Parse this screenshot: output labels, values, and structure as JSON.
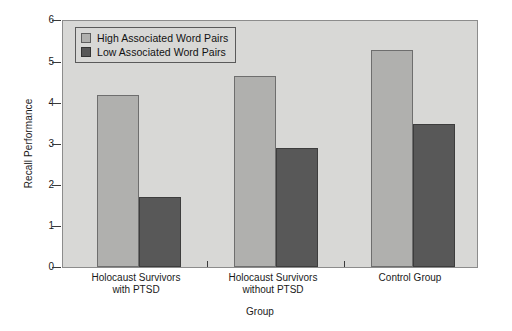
{
  "chart_data": {
    "type": "bar",
    "title": "",
    "xlabel": "Group",
    "ylabel": "Recall Performance",
    "ylim": [
      0,
      6
    ],
    "yticks": [
      0,
      1,
      2,
      3,
      4,
      5,
      6
    ],
    "ytick_labels": [
      "0",
      "1",
      "2",
      "3",
      "4",
      "5",
      "6"
    ],
    "grid": false,
    "legend_position": "upper left (inside axes)",
    "categories": [
      "Holocaust Survivors with PTSD",
      "Holocaust Survivors without PTSD",
      "Control Group"
    ],
    "category_lines": [
      [
        "Holocaust Survivors",
        "with PTSD"
      ],
      [
        "Holocaust Survivors",
        "without PTSD"
      ],
      [
        "Control Group",
        ""
      ]
    ],
    "series": [
      {
        "name": "High Associated Word Pairs",
        "color": "#b0b0ae",
        "values": [
          4.2,
          4.65,
          5.3
        ]
      },
      {
        "name": "Low Associated Word Pairs",
        "color": "#585858",
        "values": [
          1.7,
          2.9,
          3.5
        ]
      }
    ]
  },
  "axes": {
    "ylabel": "Recall Performance",
    "xlabel": "Group",
    "ytick_labels": [
      "0",
      "1",
      "2",
      "3",
      "4",
      "5",
      "6"
    ]
  },
  "legend": {
    "items": [
      {
        "label": "High Associated Word Pairs",
        "swatch": "high"
      },
      {
        "label": "Low Associated Word Pairs",
        "swatch": "low"
      }
    ]
  },
  "colors": {
    "plot_background": "#d8d8d6",
    "page_background": "#ffffff",
    "high_bar": "#b0b0ae",
    "low_bar": "#585858",
    "axis": "#3a3a3a",
    "text": "#1a1a1a"
  }
}
